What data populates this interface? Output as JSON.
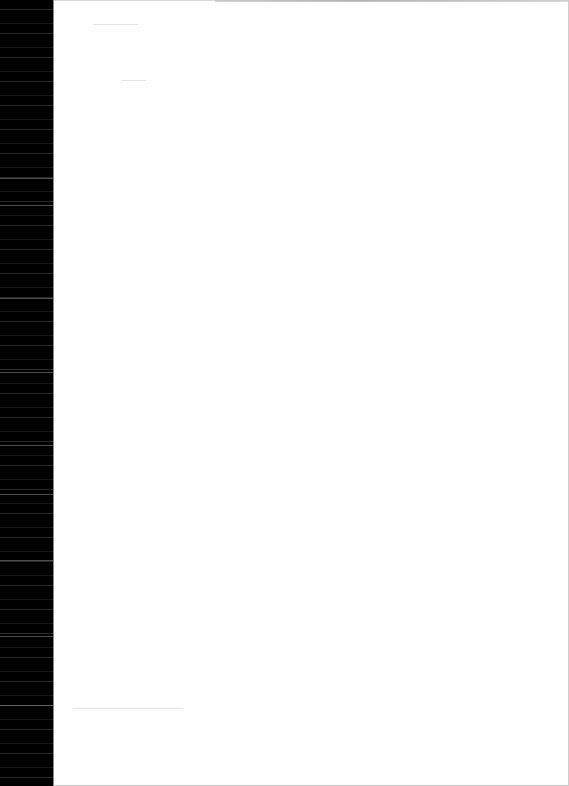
{
  "document": {
    "type": "scanned blank page",
    "page_text": "",
    "colors": {
      "scanner_strip": "#000000",
      "paper": "#ffffff",
      "edge_shadow": "#8a8a8a"
    }
  }
}
